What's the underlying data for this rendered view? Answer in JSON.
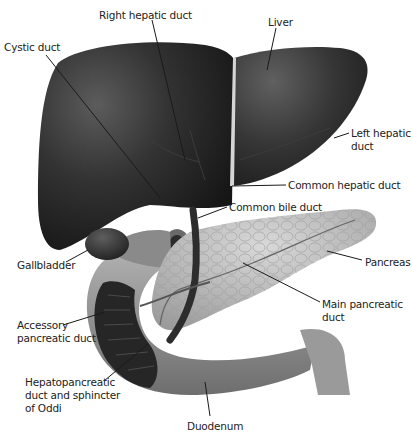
{
  "diagram": {
    "labels": [
      {
        "id": "right-hepatic-duct",
        "text": "Right hepatic duct",
        "x": 99,
        "y": 9
      },
      {
        "id": "liver",
        "text": "Liver",
        "x": 268,
        "y": 16
      },
      {
        "id": "cystic-duct",
        "text": "Cystic duct",
        "x": 4,
        "y": 41
      },
      {
        "id": "left-hepatic-duct",
        "text": "Left hepatic\nduct",
        "x": 351,
        "y": 128
      },
      {
        "id": "common-hepatic-duct",
        "text": "Common hepatic duct",
        "x": 288,
        "y": 181
      },
      {
        "id": "common-bile-duct",
        "text": "Common bile duct",
        "x": 229,
        "y": 203
      },
      {
        "id": "pancreas",
        "text": "Pancreas",
        "x": 365,
        "y": 257
      },
      {
        "id": "gallbladder",
        "text": "Gallbladder",
        "x": 17,
        "y": 259
      },
      {
        "id": "main-pancreatic-duct",
        "text": "Main pancreatic\nduct",
        "x": 322,
        "y": 296
      },
      {
        "id": "accessory-pancreatic-duct",
        "text": "Accessory\npancreatic duct",
        "x": 17,
        "y": 320
      },
      {
        "id": "hepatopancreatic-duct",
        "text": "Hepatopancreatic\nduct and sphincter\nof Oddi",
        "x": 25,
        "y": 374
      },
      {
        "id": "duodenum",
        "text": "Duodenum",
        "x": 187,
        "y": 421
      }
    ],
    "colors": {
      "liver": "#2a2a2a",
      "liver_highlight": "#5a5a5a",
      "ligament": "#d8d8d8",
      "pancreas": "#bdbdbd",
      "duodenum": "#8f8f8f",
      "duodenum_inner": "#2c2c2c",
      "leader_line": "#1a1a1a",
      "text": "#222222"
    }
  }
}
